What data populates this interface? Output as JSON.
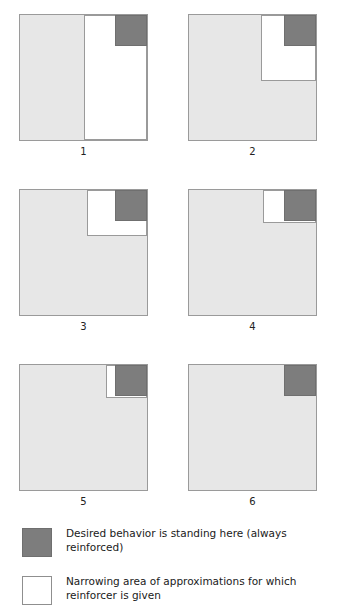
{
  "figure": {
    "colors": {
      "approximation_area": "#e7e7e7",
      "reinforced_area": "#ffffff",
      "desired_behavior": "#7d7d7d",
      "outline": "#9a9a9a",
      "background": "#ffffff"
    },
    "panels": [
      {
        "label": "1",
        "name": "panel-1",
        "regions": {
          "gray": {
            "left": "0%",
            "top": "0%",
            "width": "50%",
            "height": "100%"
          },
          "white": {
            "left": "50%",
            "top": "0%",
            "width": "50%",
            "height": "100%"
          },
          "dark": {
            "left": "75%",
            "top": "0%",
            "width": "25%",
            "height": "25%"
          }
        }
      },
      {
        "label": "2",
        "name": "panel-2",
        "regions": {
          "gray": {
            "left": "0%",
            "top": "0%",
            "width": "100%",
            "height": "100%"
          },
          "white": {
            "left": "57%",
            "top": "0%",
            "width": "43%",
            "height": "53%"
          },
          "dark": {
            "left": "75%",
            "top": "0%",
            "width": "25%",
            "height": "25%"
          }
        }
      },
      {
        "label": "3",
        "name": "panel-3",
        "regions": {
          "gray": {
            "left": "0%",
            "top": "0%",
            "width": "100%",
            "height": "100%"
          },
          "white": {
            "left": "53%",
            "top": "0%",
            "width": "47%",
            "height": "37%"
          },
          "dark": {
            "left": "75%",
            "top": "0%",
            "width": "25%",
            "height": "25%"
          }
        }
      },
      {
        "label": "4",
        "name": "panel-4",
        "regions": {
          "gray": {
            "left": "0%",
            "top": "0%",
            "width": "100%",
            "height": "100%"
          },
          "white": {
            "left": "58%",
            "top": "0%",
            "width": "42%",
            "height": "26%"
          },
          "dark": {
            "left": "75%",
            "top": "0%",
            "width": "25%",
            "height": "25%"
          }
        }
      },
      {
        "label": "5",
        "name": "panel-5",
        "regions": {
          "gray": {
            "left": "0%",
            "top": "0%",
            "width": "100%",
            "height": "100%"
          },
          "white": {
            "left": "68%",
            "top": "0%",
            "width": "32%",
            "height": "26%"
          },
          "dark": {
            "left": "75%",
            "top": "0%",
            "width": "25%",
            "height": "25%"
          }
        }
      },
      {
        "label": "6",
        "name": "panel-6",
        "regions": {
          "gray": {
            "left": "0%",
            "top": "0%",
            "width": "100%",
            "height": "100%"
          },
          "white": null,
          "dark": {
            "left": "75%",
            "top": "0%",
            "width": "25%",
            "height": "25%"
          }
        }
      }
    ]
  },
  "legend": {
    "items": [
      {
        "swatch": "dark",
        "text": "Desired behavior is standing here (always reinforced)"
      },
      {
        "swatch": "white",
        "text": "Narrowing area of approximations for which reinforcer is given"
      }
    ]
  }
}
